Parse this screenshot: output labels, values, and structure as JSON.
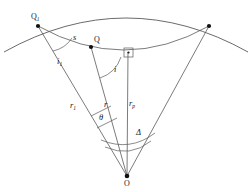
{
  "figure": {
    "type": "geometry-diagram",
    "title": "",
    "background_color": "#ffffff",
    "stroke_color": "#4d4d4d",
    "point_color": "#111111",
    "label_color": "#1a1a1a",
    "width": 252,
    "height": 192
  },
  "points": [
    {
      "id": "Q1",
      "label": "Q",
      "subscript": "1",
      "x": 38,
      "y": 26,
      "label_x": 31,
      "label_y": 13
    },
    {
      "id": "Q",
      "label": "Q",
      "subscript": "",
      "x": 91,
      "y": 47,
      "label_x": 94,
      "label_y": 36
    },
    {
      "id": "R",
      "label": "",
      "subscript": "",
      "x": 209,
      "y": 26,
      "label_x": 0,
      "label_y": 0
    },
    {
      "id": "O",
      "label": "O",
      "subscript": "",
      "x": 127,
      "y": 176,
      "label_x": 124,
      "label_y": 180
    }
  ],
  "labels": [
    {
      "id": "s",
      "text": "s",
      "sub": "",
      "x": 73,
      "y": 33,
      "style": "italic"
    },
    {
      "id": "i1",
      "text": "i",
      "sub": "1",
      "x": 57,
      "y": 57,
      "style": "italic"
    },
    {
      "id": "i",
      "text": "i",
      "sub": "",
      "x": 114,
      "y": 65,
      "style": "italic"
    },
    {
      "id": "r1",
      "text": "r",
      "sub": "1",
      "x": 70,
      "y": 101,
      "style": "italic"
    },
    {
      "id": "r",
      "text": "r",
      "sub": "",
      "x": 104,
      "y": 100,
      "style": "italic"
    },
    {
      "id": "rp",
      "text": "r",
      "sub": "p",
      "x": 129,
      "y": 99,
      "style": "italic"
    },
    {
      "id": "theta",
      "text": "θ",
      "sub": "",
      "x": 99,
      "y": 113,
      "style": "greek"
    },
    {
      "id": "delta",
      "text": "Δ",
      "sub": "",
      "x": 136,
      "y": 128,
      "style": "greek"
    }
  ],
  "markers": [
    {
      "id": "right-angle",
      "type": "square-with-dot",
      "x": 128,
      "y": 52,
      "size": 9
    }
  ],
  "segments": [
    {
      "id": "O-Q1",
      "from": "O",
      "to": "Q1"
    },
    {
      "id": "O-Q",
      "from": "O",
      "to": "Q"
    },
    {
      "id": "O-P",
      "from": "O",
      "to": "P"
    },
    {
      "id": "O-R",
      "from": "O",
      "to": "R"
    }
  ],
  "arcs": [
    {
      "id": "surface-arc",
      "description": "earth-surface-arc"
    },
    {
      "id": "ray-path-arc",
      "description": "ray-path-arc"
    },
    {
      "id": "angle-i1-arc",
      "description": "angle-i1-arc"
    },
    {
      "id": "angle-i-arc",
      "description": "angle-i-arc"
    },
    {
      "id": "angle-theta-arc",
      "description": "angle-theta-arc"
    },
    {
      "id": "angle-delta-arc",
      "description": "angle-delta-arc"
    },
    {
      "id": "angle-delta-arc-inner",
      "description": "angle-delta-arc-inner"
    }
  ]
}
